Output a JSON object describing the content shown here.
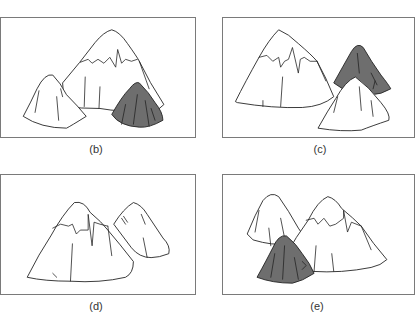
{
  "figure": {
    "panels": [
      {
        "id": "b",
        "label": "(b)",
        "description": "Large snow-capped mountain center, small white peak left-front, dark shaded peak right-front"
      },
      {
        "id": "c",
        "label": "(c)",
        "description": "Large snow-capped mountain left, dark shaded peak behind right, small white peak right-front"
      },
      {
        "id": "d",
        "label": "(d)",
        "description": "Large snow-capped mountain left, small white peak right-back"
      },
      {
        "id": "e",
        "label": "(e)",
        "description": "Small white peak left-back, large snow-capped mountain right, dark shaded peak left-front"
      }
    ],
    "colors": {
      "frame": "#7a7a7a",
      "outline": "#222222",
      "shaded_peak": "#6e6e6e",
      "background": "#ffffff"
    }
  }
}
